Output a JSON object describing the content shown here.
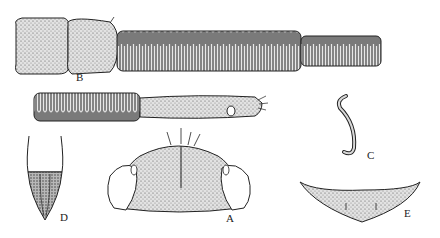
{
  "figure": {
    "panels": [
      {
        "id": "A",
        "label": "A",
        "depicts": "head capsule, frontal view"
      },
      {
        "id": "B",
        "label": "B",
        "depicts": "segmented appendage with ringed annuli (long)"
      },
      {
        "id": "B2",
        "label": "",
        "depicts": "continuation of annulated appendage with terminal segment"
      },
      {
        "id": "C",
        "label": "C",
        "depicts": "curved hook-shaped structure"
      },
      {
        "id": "D",
        "label": "D",
        "depicts": "terminal segment, tapered"
      },
      {
        "id": "E",
        "label": "E",
        "depicts": "crescent-shaped plate"
      }
    ],
    "style": {
      "ink": "#1a1a1a",
      "stipple_fill": "#cfcfcf",
      "dark_fill": "#8a8a8a",
      "background": "#ffffff"
    }
  }
}
